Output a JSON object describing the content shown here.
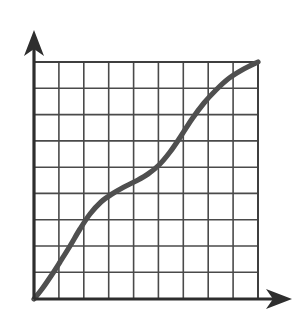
{
  "figure": {
    "title": "",
    "background_color": "#ffffff",
    "width": 302,
    "height": 332
  },
  "axes": {
    "x_axis": {
      "name": "x-axis",
      "label": "",
      "color": "#2e2e2e",
      "arrow": "right-arrow",
      "start_px": [
        34,
        299
      ],
      "end_px": [
        292,
        299
      ]
    },
    "y_axis": {
      "name": "y-axis",
      "label": "",
      "color": "#2e2e2e",
      "arrow": "up-arrow",
      "start_px": [
        34,
        299
      ],
      "end_px": [
        34,
        30
      ]
    }
  },
  "grid": {
    "color": "#4a4a4a",
    "visible": true,
    "columns": 9,
    "rows": 9,
    "left_px": 34,
    "top_px": 62,
    "right_px": 258,
    "bottom_px": 299,
    "cell_width_px": 24.9,
    "cell_height_px": 26.3,
    "x_gridline_positions": [
      34,
      58.9,
      83.8,
      108.7,
      133.6,
      158.4,
      183.3,
      208.2,
      233.1,
      258
    ],
    "y_gridline_positions": [
      62,
      88.3,
      114.6,
      140.9,
      167.2,
      193.4,
      219.7,
      246,
      272.3,
      299
    ]
  },
  "chart_data": {
    "type": "line",
    "title": "",
    "subtitle": "",
    "xlabel": "",
    "ylabel": "",
    "xlim": [
      0,
      9
    ],
    "ylim": [
      0,
      9
    ],
    "grid": true,
    "legend": false,
    "legend_position": "none",
    "annotations": [],
    "series": [
      {
        "name": "sigmoid-curve",
        "color": "#4f4f4f",
        "line_width": 5.2,
        "marker": "none",
        "shape": "s-curve",
        "x": [
          0,
          0.45,
          0.9,
          1.35,
          1.8,
          2.25,
          2.7,
          3.15,
          3.6,
          4.05,
          4.5,
          4.95,
          5.4,
          5.85,
          6.3,
          6.75,
          7.2,
          7.65,
          8.1,
          8.55,
          9
        ],
        "y": [
          0,
          0.55,
          1.15,
          1.8,
          2.45,
          3.05,
          3.5,
          3.85,
          4.1,
          4.3,
          4.5,
          4.75,
          5.1,
          5.6,
          6.25,
          6.95,
          7.6,
          8.1,
          8.5,
          8.78,
          9
        ]
      }
    ],
    "path_points_px": [
      [
        34,
        299
      ],
      [
        42,
        289
      ],
      [
        51,
        276
      ],
      [
        60,
        262
      ],
      [
        70,
        246
      ],
      [
        80,
        229
      ],
      [
        90,
        214
      ],
      [
        101,
        202
      ],
      [
        112,
        194
      ],
      [
        124,
        187
      ],
      [
        136,
        181
      ],
      [
        148,
        174
      ],
      [
        159,
        165
      ],
      [
        170,
        152
      ],
      [
        181,
        136
      ],
      [
        192,
        119
      ],
      [
        204,
        103
      ],
      [
        216,
        90
      ],
      [
        228,
        79
      ],
      [
        242,
        70
      ],
      [
        258,
        62
      ]
    ]
  },
  "colors": {
    "curve": "#4f4f4f",
    "grid": "#4a4a4a",
    "axis": "#2e2e2e",
    "background": "#ffffff"
  }
}
